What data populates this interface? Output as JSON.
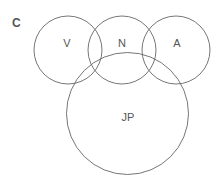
{
  "panel_label": "C",
  "diagram": {
    "type": "venn",
    "stroke_color": "#666666",
    "sets": [
      {
        "id": "V",
        "label": "V",
        "cx": 68,
        "cy": 50,
        "r": 34
      },
      {
        "id": "N",
        "label": "N",
        "cx": 122,
        "cy": 50,
        "r": 34
      },
      {
        "id": "A",
        "label": "A",
        "cx": 176,
        "cy": 50,
        "r": 34
      },
      {
        "id": "JP",
        "label": "JP",
        "cx": 127.5,
        "cy": 113.5,
        "r": 61
      }
    ]
  }
}
